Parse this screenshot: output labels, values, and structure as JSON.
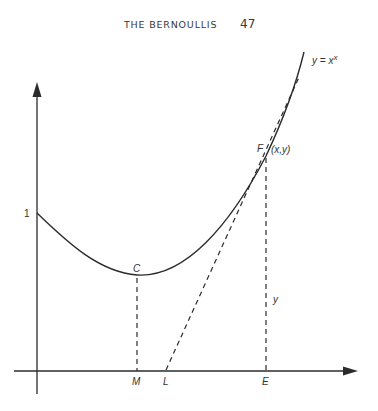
{
  "header": {
    "running_head": "THE BERNOULLIS",
    "page_number": "47"
  },
  "figure": {
    "curve_label": "y = x",
    "curve_label_exp": "x",
    "y_intercept_label": "1",
    "points": {
      "C": "C",
      "F": "F",
      "F_coords": "(x,y)",
      "M": "M",
      "L": "L",
      "E": "E",
      "y_segment": "y"
    },
    "colors": {
      "ink": "#2b2b2b",
      "text": "#333333"
    }
  }
}
